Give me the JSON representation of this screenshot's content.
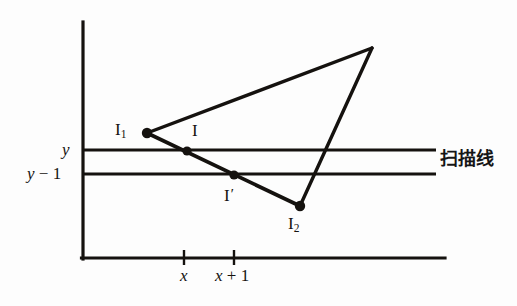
{
  "figure": {
    "background_color": "#fdfdfd",
    "ink_color": "#15120f",
    "labels": {
      "axis_y": "y",
      "axis_y_minus_1_left": "y",
      "axis_y_minus_1_op": " − ",
      "axis_y_minus_1_num": "1",
      "vertex_i1_base": "I",
      "vertex_i1_sub": "1",
      "point_i": "I",
      "point_i_prime_base": "I",
      "point_i_prime_mark": "′",
      "vertex_i2_base": "I",
      "vertex_i2_sub": "2",
      "scanline": "扫描线",
      "tick_x": "x",
      "tick_x_plus_1_var": "x",
      "tick_x_plus_1_op": " + ",
      "tick_x_plus_1_num": "1"
    },
    "geometry": {
      "y_axis": {
        "x": 83,
        "y_top": 22,
        "y_bottom": 259
      },
      "x_axis": {
        "y": 258,
        "x_left": 83,
        "x_right": 445
      },
      "scanline_upper": {
        "y": 150,
        "x_left": 84,
        "x_right": 436
      },
      "scanline_lower": {
        "y": 174,
        "x_left": 84,
        "x_right": 436
      },
      "ticks": [
        {
          "label": "x",
          "x": 184
        },
        {
          "label": "x + 1",
          "x": 234
        }
      ],
      "triangle_vertices": [
        {
          "name": "I1",
          "x": 147,
          "y": 133
        },
        {
          "name": "apex",
          "x": 372,
          "y": 48
        },
        {
          "name": "I2",
          "x": 300,
          "y": 206
        }
      ],
      "marked_points": [
        {
          "name": "I1",
          "x": 147,
          "y": 133
        },
        {
          "name": "I",
          "x": 187,
          "y": 151
        },
        {
          "name": "I-prime",
          "x": 234,
          "y": 175
        },
        {
          "name": "I2",
          "x": 300,
          "y": 206
        }
      ]
    }
  }
}
